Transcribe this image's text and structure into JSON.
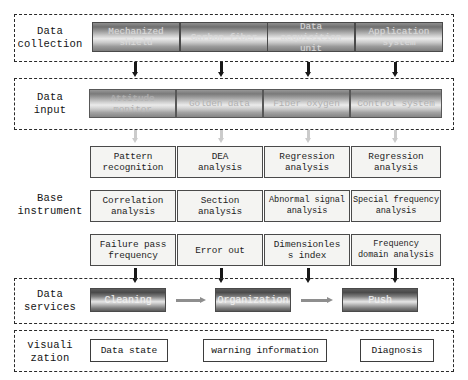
{
  "diagram": {
    "sections": [
      {
        "id": "data-collection",
        "label": "Data\ncollection",
        "nodes": [
          {
            "label": "Mechanized\nshield"
          },
          {
            "label": "Carbon fiber"
          },
          {
            "label": "Data acquisition\nunit"
          },
          {
            "label": "Application\nsystem"
          }
        ]
      },
      {
        "id": "data-input",
        "label": "Data\ninput",
        "nodes": [
          {
            "label": "Attitude monitor"
          },
          {
            "label": "Golden data"
          },
          {
            "label": "Fiber oxygen"
          },
          {
            "label": "Control system"
          }
        ]
      },
      {
        "id": "base-instrument",
        "label": "Base\ninstrument",
        "rows": [
          [
            {
              "label": "Pattern\nrecognition"
            },
            {
              "label": "DEA\nanalysis"
            },
            {
              "label": "Regression\nanalysis"
            },
            {
              "label": "Regression\nanalysis"
            }
          ],
          [
            {
              "label": "Correlation\nanalysis"
            },
            {
              "label": "Section\nanalysis"
            },
            {
              "label": "Abnormal signal\nanalysis"
            },
            {
              "label": "Special frequency\nanalysis"
            }
          ],
          [
            {
              "label": "Failure pass\nfrequency"
            },
            {
              "label": "Error out"
            },
            {
              "label": "Dimensionles\ns index"
            },
            {
              "label": "Frequency\ndomain analysis"
            }
          ]
        ]
      },
      {
        "id": "data-services",
        "label": "Data\nservices",
        "nodes": [
          {
            "label": "Cleaning"
          },
          {
            "label": "Organization"
          },
          {
            "label": "Push"
          }
        ]
      },
      {
        "id": "visualization",
        "label": "visuali\nzation",
        "nodes": [
          {
            "label": "Data state"
          },
          {
            "label": "warning information"
          },
          {
            "label": "Diagnosis"
          }
        ]
      }
    ]
  },
  "colors": {
    "frame": "#2a2a2a",
    "box_border": "#4a4a4a",
    "box_fill": "#f4f4f2",
    "arrow_dark": "#171717",
    "arrow_gray": "#8e8e8e",
    "text": "#1a1a1a"
  }
}
